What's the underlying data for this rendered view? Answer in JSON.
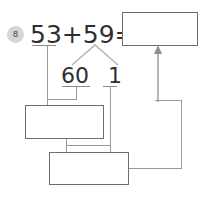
{
  "worksheet": {
    "problem_number": "8",
    "equation": "53+59=",
    "decomposition": {
      "part_a": "60",
      "part_b": "1"
    },
    "answer_box_value": "",
    "work_box_1_value": "",
    "work_box_2_value": "",
    "colors": {
      "badge_fill": "#d6d6d6",
      "ink": "#2f2f2f",
      "box_border": "#6f6f6f",
      "connector": "#9a9a9a"
    }
  }
}
